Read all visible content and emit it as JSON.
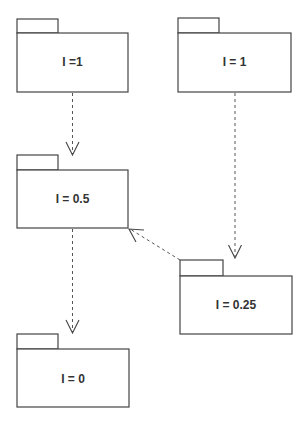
{
  "diagram": {
    "type": "UML package dependency diagram",
    "packages": [
      {
        "id": "pkg-a",
        "label": "I =1"
      },
      {
        "id": "pkg-b",
        "label": "I = 1"
      },
      {
        "id": "pkg-c",
        "label": "I = 0.5"
      },
      {
        "id": "pkg-d",
        "label": "I = 0.25"
      },
      {
        "id": "pkg-e",
        "label": "I = 0"
      }
    ],
    "dependencies": [
      {
        "from": "pkg-a",
        "to": "pkg-c",
        "style": "dashed-open-arrow"
      },
      {
        "from": "pkg-b",
        "to": "pkg-d",
        "style": "dashed-open-arrow"
      },
      {
        "from": "pkg-d",
        "to": "pkg-c",
        "style": "dashed-open-arrow"
      },
      {
        "from": "pkg-c",
        "to": "pkg-e",
        "style": "dashed-open-arrow"
      }
    ]
  }
}
